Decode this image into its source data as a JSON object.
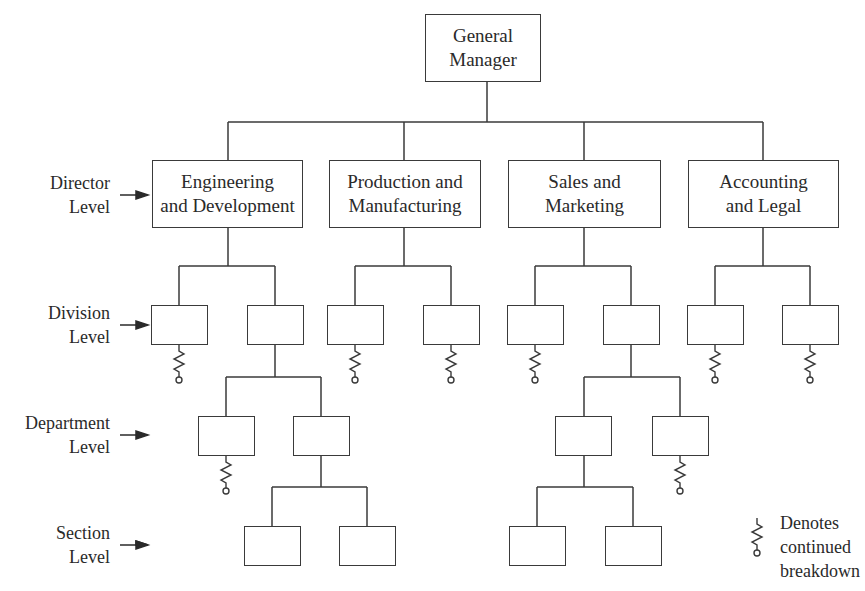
{
  "diagram": {
    "type": "organization-chart",
    "line_color": "#3a3a3a",
    "top": {
      "label_line1": "General",
      "label_line2": "Manager"
    },
    "directors": [
      {
        "line1": "Engineering",
        "line2": "and Development"
      },
      {
        "line1": "Production and",
        "line2": "Manufacturing"
      },
      {
        "line1": "Sales and",
        "line2": "Marketing"
      },
      {
        "line1": "Accounting",
        "line2": "and Legal"
      }
    ],
    "levels": [
      {
        "line1": "Director",
        "line2": "Level"
      },
      {
        "line1": "Division",
        "line2": "Level"
      },
      {
        "line1": "Department",
        "line2": "Level"
      },
      {
        "line1": "Section",
        "line2": "Level"
      }
    ],
    "legend": {
      "icon": "continued-breakdown-icon",
      "line1": "Denotes",
      "line2": "continued",
      "line3": "breakdown"
    }
  }
}
